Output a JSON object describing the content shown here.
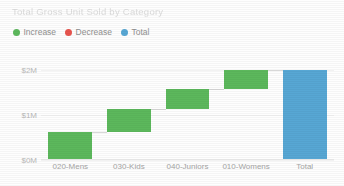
{
  "header": {
    "title": "Total Gross Unit Sold by Category"
  },
  "legend": {
    "position": "top-left",
    "items": [
      {
        "label": "Increase",
        "color": "#5CB85C",
        "icon": "circle-icon"
      },
      {
        "label": "Decrease",
        "color": "#E8554E",
        "icon": "circle-icon"
      },
      {
        "label": "Total",
        "color": "#57A7D4",
        "icon": "circle-icon"
      }
    ]
  },
  "chart_data": {
    "type": "bar",
    "subtype": "waterfall",
    "title": "Total Gross Unit Sold by Category",
    "xlabel": "",
    "ylabel": "",
    "categories": [
      "020-Mens",
      "030-Kids",
      "040-Juniors",
      "010-Womens",
      "Total"
    ],
    "series": [
      {
        "name": "Total Gross Unit Sold",
        "values": [
          0.63,
          0.5,
          0.45,
          0.42,
          2.0
        ],
        "cumulative_start": [
          0.0,
          0.63,
          1.13,
          1.58,
          0.0
        ],
        "cumulative_end": [
          0.63,
          1.13,
          1.58,
          2.0,
          2.0
        ],
        "kinds": [
          "increase",
          "increase",
          "increase",
          "increase",
          "total"
        ]
      }
    ],
    "ylim": [
      0,
      2.22
    ],
    "yticks": [
      0,
      1,
      2
    ],
    "ytick_labels": [
      "$0M",
      "$1M",
      "$2M"
    ],
    "grid": true,
    "legend_position": "top-left",
    "colors": {
      "increase": "#5CB85C",
      "decrease": "#E8554E",
      "total": "#57A7D4",
      "gridline": "#F2F2F2",
      "connector": "#D8D8D8",
      "axis_text": "#A5A5A5",
      "title_text": "#DCDCDC",
      "background": "#FFFFFF"
    }
  }
}
